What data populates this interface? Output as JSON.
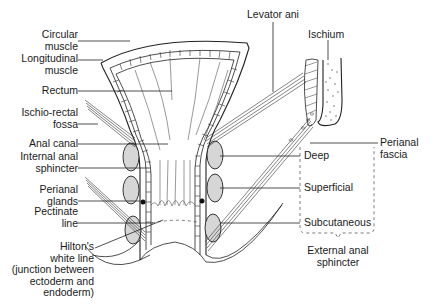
{
  "diagram": {
    "labels_left": {
      "circular_muscle": "Circular\nmuscle",
      "longitudinal_muscle": "Longitudinal\nmuscle",
      "rectum": "Rectum",
      "ischio_rectal_fossa": "Ischio-rectal\nfossa",
      "anal_canal": "Anal canal",
      "internal_anal_sphincter": "Internal anal\nsphincter",
      "perianal_glands": "Perianal\nglands",
      "pectinate_line": "Pectinate\nline",
      "hiltons_white_line": "Hilton's\nwhite line\n(junction between\nectoderm and\nendoderm)"
    },
    "labels_right": {
      "levator_ani": "Levator ani",
      "ischium": "Ischium",
      "perianal_fascia": "Perianal\nfascia",
      "deep": "Deep",
      "superficial": "Superficial",
      "subcutaneous": "Subcutaneous",
      "external_anal_sphincter": "External anal\nsphincter"
    }
  }
}
